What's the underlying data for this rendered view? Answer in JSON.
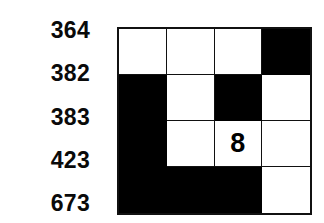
{
  "page": {
    "background_color": "#ffffff",
    "ink_color": "#000000"
  },
  "labels": {
    "name": "row-number-labels",
    "items": [
      {
        "text": "364"
      },
      {
        "text": "382"
      },
      {
        "text": "383"
      },
      {
        "text": "423"
      },
      {
        "text": "673"
      }
    ]
  },
  "grid": {
    "name": "puzzle-grid",
    "rows": 4,
    "columns": 4,
    "border_color": "#111111",
    "filled_color": "#000000",
    "empty_color": "#ffffff",
    "cells": [
      {
        "row": 1,
        "col": 1,
        "state": "empty",
        "value": ""
      },
      {
        "row": 1,
        "col": 2,
        "state": "empty",
        "value": ""
      },
      {
        "row": 1,
        "col": 3,
        "state": "empty",
        "value": ""
      },
      {
        "row": 1,
        "col": 4,
        "state": "filled",
        "value": ""
      },
      {
        "row": 2,
        "col": 1,
        "state": "filled",
        "value": ""
      },
      {
        "row": 2,
        "col": 2,
        "state": "empty",
        "value": ""
      },
      {
        "row": 2,
        "col": 3,
        "state": "filled",
        "value": ""
      },
      {
        "row": 2,
        "col": 4,
        "state": "empty",
        "value": ""
      },
      {
        "row": 3,
        "col": 1,
        "state": "filled",
        "value": ""
      },
      {
        "row": 3,
        "col": 2,
        "state": "empty",
        "value": ""
      },
      {
        "row": 3,
        "col": 3,
        "state": "empty",
        "value": "8"
      },
      {
        "row": 3,
        "col": 4,
        "state": "empty",
        "value": ""
      },
      {
        "row": 4,
        "col": 1,
        "state": "filled",
        "value": ""
      },
      {
        "row": 4,
        "col": 2,
        "state": "filled",
        "value": ""
      },
      {
        "row": 4,
        "col": 3,
        "state": "filled",
        "value": ""
      },
      {
        "row": 4,
        "col": 4,
        "state": "empty",
        "value": ""
      }
    ]
  }
}
